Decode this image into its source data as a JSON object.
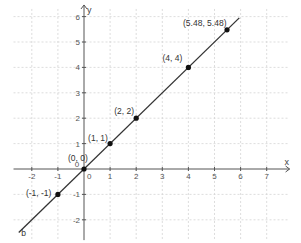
{
  "chart_data": {
    "type": "line",
    "title": "",
    "xlabel": "x",
    "ylabel": "y",
    "xlim": [
      -2.7,
      7.8
    ],
    "ylim": [
      -2.8,
      6.3
    ],
    "grid": true,
    "x_ticks": [
      -2,
      -1,
      0,
      1,
      2,
      3,
      4,
      5,
      6,
      7
    ],
    "y_ticks": [
      -2,
      -1,
      0,
      1,
      2,
      3,
      4,
      5,
      6
    ],
    "origin_label": "0",
    "series": [
      {
        "name": "b",
        "kind": "line",
        "equation": "y = x",
        "x": [
          -2.5,
          5.95
        ],
        "y": [
          -2.5,
          5.95
        ],
        "color": "#333333"
      },
      {
        "name": "points",
        "kind": "scatter",
        "color": "#111111",
        "points": [
          {
            "x": -1,
            "y": -1,
            "label": "(-1, -1)"
          },
          {
            "x": 0,
            "y": 0,
            "label": "(0, 0)"
          },
          {
            "x": 1,
            "y": 1,
            "label": "(1, 1)"
          },
          {
            "x": 2,
            "y": 2,
            "label": "(2, 2)"
          },
          {
            "x": 4,
            "y": 4,
            "label": "(4, 4)"
          },
          {
            "x": 5.48,
            "y": 5.48,
            "label": "(5.48, 5.48)"
          }
        ]
      }
    ],
    "annotations": [
      {
        "text": "b",
        "x": -2.4,
        "y": -2.65,
        "note": "line name label"
      }
    ]
  }
}
